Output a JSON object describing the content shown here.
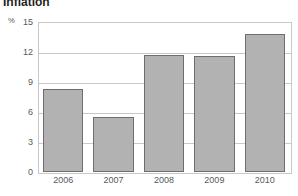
{
  "chart_data": {
    "type": "bar",
    "title": "Inflation",
    "xlabel": "",
    "ylabel": "%",
    "unit_label": "%",
    "categories": [
      "2006",
      "2007",
      "2008",
      "2009",
      "2010"
    ],
    "values": [
      8.3,
      5.5,
      11.7,
      11.6,
      13.8
    ],
    "ylim": [
      0,
      15
    ],
    "yticks": [
      0,
      3,
      6,
      9,
      12,
      15
    ],
    "ytick_labels": [
      "0",
      "3",
      "6",
      "9",
      "12",
      "15"
    ],
    "grid": true,
    "grid_axis": "y",
    "legend": false,
    "legend_position": "none",
    "bar_color": "#b2b2b2",
    "bar_border_color": "#6d6e70",
    "grid_color": "#c8c8c8",
    "text_color": "#58595b",
    "title_color": "#231f20",
    "background": "#ffffff"
  }
}
